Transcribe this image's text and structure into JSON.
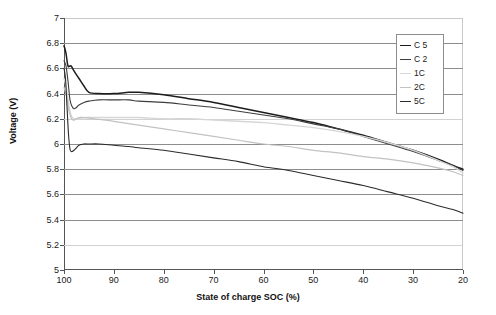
{
  "chart_data": {
    "type": "line",
    "title": "",
    "xlabel": "State of charge SOC (%)",
    "ylabel": "Voltage (V)",
    "xlim": [
      100,
      20
    ],
    "ylim": [
      5,
      7
    ],
    "x_reversed": true,
    "grid": "horizontal",
    "legend_position": "top-right",
    "xticks": [
      100,
      90,
      80,
      70,
      60,
      50,
      40,
      30,
      20
    ],
    "yticks": [
      5,
      5.2,
      5.4,
      5.6,
      5.8,
      6,
      6.2,
      6.4,
      6.6,
      6.8,
      7
    ],
    "xtick_labels": [
      "100",
      "90",
      "80",
      "70",
      "60",
      "50",
      "40",
      "30",
      "20"
    ],
    "ytick_labels": [
      "5",
      "5.2",
      "5.4",
      "5.6",
      "5.8",
      "6",
      "6.2",
      "6.4",
      "6.6",
      "6.8",
      "7"
    ],
    "series": [
      {
        "name": "C 5",
        "color": "#1c1c1c",
        "width": 1.5,
        "x": [
          100,
          99.6,
          99.2,
          98.6,
          98,
          97,
          96,
          95,
          93,
          90,
          87,
          85,
          80,
          75,
          70,
          65,
          60,
          55,
          50,
          45,
          40,
          35,
          30,
          25,
          22,
          20
        ],
        "y": [
          6.78,
          6.72,
          6.62,
          6.62,
          6.58,
          6.52,
          6.46,
          6.41,
          6.4,
          6.4,
          6.41,
          6.41,
          6.39,
          6.36,
          6.33,
          6.29,
          6.25,
          6.21,
          6.17,
          6.12,
          6.07,
          6.01,
          5.95,
          5.88,
          5.83,
          5.8
        ]
      },
      {
        "name": "C 2",
        "color": "#3d3d3d",
        "width": 1.1,
        "x": [
          100,
          99.6,
          99.2,
          98.8,
          98.4,
          98,
          97.5,
          97,
          96,
          95,
          93,
          90,
          87,
          85,
          80,
          75,
          70,
          65,
          60,
          55,
          50,
          45,
          40,
          35,
          30,
          25,
          22,
          20
        ],
        "y": [
          6.66,
          6.62,
          6.5,
          6.35,
          6.3,
          6.28,
          6.29,
          6.31,
          6.33,
          6.34,
          6.35,
          6.35,
          6.35,
          6.34,
          6.33,
          6.31,
          6.29,
          6.26,
          6.23,
          6.2,
          6.16,
          6.12,
          6.06,
          6.0,
          5.94,
          5.87,
          5.83,
          5.79
        ]
      },
      {
        "name": "1C",
        "color": "#d6d6d6",
        "width": 1.4,
        "x": [
          100,
          99.5,
          99,
          98.5,
          98,
          97,
          96,
          94,
          90,
          85,
          80,
          75,
          70,
          65,
          60,
          55,
          50,
          45,
          40,
          35,
          30,
          25,
          22,
          20
        ],
        "y": [
          6.52,
          6.44,
          6.3,
          6.22,
          6.2,
          6.2,
          6.21,
          6.21,
          6.21,
          6.21,
          6.2,
          6.2,
          6.19,
          6.18,
          6.17,
          6.15,
          6.13,
          6.1,
          6.06,
          6.01,
          5.95,
          5.87,
          5.82,
          5.77
        ]
      },
      {
        "name": "2C",
        "color": "#c2c2c2",
        "width": 1.2,
        "x": [
          100,
          99.5,
          99,
          98.5,
          98,
          97.5,
          97,
          96,
          94,
          90,
          85,
          80,
          75,
          70,
          65,
          60,
          55,
          50,
          45,
          40,
          35,
          30,
          25,
          22,
          20
        ],
        "y": [
          6.45,
          6.38,
          6.26,
          6.2,
          6.19,
          6.2,
          6.21,
          6.21,
          6.2,
          6.18,
          6.15,
          6.12,
          6.09,
          6.06,
          6.03,
          6.0,
          5.98,
          5.95,
          5.93,
          5.9,
          5.88,
          5.85,
          5.81,
          5.78,
          5.75
        ]
      },
      {
        "name": "5C",
        "color": "#2b2b2b",
        "width": 1.1,
        "x": [
          100,
          99.7,
          99.4,
          99.1,
          98.8,
          98.5,
          98,
          97.5,
          97,
          96,
          95,
          93,
          90,
          87,
          85,
          80,
          75,
          70,
          65,
          60,
          55,
          50,
          45,
          40,
          35,
          30,
          25,
          22,
          20
        ],
        "y": [
          6.6,
          6.52,
          6.3,
          6.08,
          5.96,
          5.94,
          5.95,
          5.97,
          5.99,
          6.0,
          6.0,
          6.0,
          5.99,
          5.98,
          5.97,
          5.95,
          5.92,
          5.89,
          5.86,
          5.82,
          5.79,
          5.75,
          5.71,
          5.67,
          5.62,
          5.57,
          5.51,
          5.48,
          5.45
        ]
      }
    ]
  },
  "legend": {
    "items": [
      {
        "label": "C 5"
      },
      {
        "label": "C 2"
      },
      {
        "label": "1C"
      },
      {
        "label": "2C"
      },
      {
        "label": "5C"
      }
    ]
  },
  "axes": {
    "y_title": "Voltage (V)",
    "x_title": "State of charge SOC (%)"
  }
}
